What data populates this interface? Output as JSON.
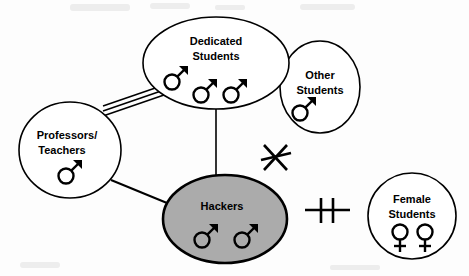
{
  "diagram": {
    "background_color": "#fdfdfd",
    "outline_color": "#000000",
    "highlight_fill_color": "#ababab",
    "nodes": [
      {
        "id": "dedicated-students",
        "label_lines": [
          "Dedicated",
          "Students"
        ],
        "label_line1": "Dedicated",
        "label_line2": "Students",
        "shape": "ellipse",
        "fill": "#ffffff",
        "cx": 216,
        "cy": 63,
        "rx": 73,
        "ry": 46,
        "members": [
          {
            "gender": "male",
            "symbol": "mars",
            "x": 172,
            "y": 79
          },
          {
            "gender": "male",
            "symbol": "mars",
            "x": 201,
            "y": 92
          },
          {
            "gender": "male",
            "symbol": "mars",
            "x": 231,
            "y": 92
          }
        ],
        "member_count": 3
      },
      {
        "id": "other-students",
        "label_lines": [
          "Other",
          "Students"
        ],
        "label_line1": "Other",
        "label_line2": "Students",
        "shape": "circle",
        "fill": "#ffffff",
        "cx": 320,
        "cy": 87,
        "rx": 40,
        "ry": 46,
        "members": [
          {
            "gender": "male",
            "symbol": "mars",
            "x": 302,
            "y": 110
          }
        ],
        "member_count": 1
      },
      {
        "id": "professors-teachers",
        "label_lines": [
          "Professors/",
          "Teachers"
        ],
        "label_line1": "Professors/",
        "label_line2": "Teachers",
        "shape": "circle",
        "fill": "#ffffff",
        "cx": 70,
        "cy": 150,
        "rx": 51,
        "ry": 48,
        "members": [
          {
            "gender": "male",
            "symbol": "mars",
            "x": 66,
            "y": 173
          }
        ],
        "member_count": 1
      },
      {
        "id": "hackers",
        "label_lines": [
          "Hackers"
        ],
        "label_line1": "Hackers",
        "label_line2": "",
        "shape": "ellipse",
        "fill": "#ababab",
        "cx": 225,
        "cy": 219,
        "rx": 62,
        "ry": 44,
        "members": [
          {
            "gender": "male",
            "symbol": "mars",
            "x": 202,
            "y": 237
          },
          {
            "gender": "male",
            "symbol": "mars",
            "x": 242,
            "y": 237
          }
        ],
        "member_count": 2
      },
      {
        "id": "female-students",
        "label_lines": [
          "Female",
          "Students"
        ],
        "label_line1": "Female",
        "label_line2": "Students",
        "shape": "circle",
        "fill": "#ffffff",
        "cx": 412,
        "cy": 216,
        "rx": 44,
        "ry": 43,
        "members": [
          {
            "gender": "female",
            "symbol": "venus",
            "x": 400,
            "y": 236
          },
          {
            "gender": "female",
            "symbol": "venus",
            "x": 425,
            "y": 236
          }
        ],
        "member_count": 2
      }
    ],
    "edges": [
      {
        "id": "professors-to-dedicated",
        "from": "professors-teachers",
        "to": "dedicated-students",
        "style": "triple-line",
        "line_count": 3,
        "x1": 103,
        "y1": 111,
        "x2": 163,
        "y2": 90
      },
      {
        "id": "dedicated-to-hackers",
        "from": "dedicated-students",
        "to": "hackers",
        "style": "single-line",
        "line_count": 1,
        "x1": 216,
        "y1": 108,
        "x2": 216,
        "y2": 177
      },
      {
        "id": "professors-to-hackers",
        "from": "professors-teachers",
        "to": "hackers",
        "style": "single-line",
        "line_count": 1,
        "x1": 111,
        "y1": 180,
        "x2": 167,
        "y2": 203
      }
    ],
    "markers": [
      {
        "id": "crossed-out-x",
        "type": "x-with-strike",
        "meaning": "no-connection",
        "cx": 275,
        "cy": 157,
        "size": 26
      },
      {
        "id": "double-bar",
        "type": "line-with-two-bars",
        "meaning": "blocked-connection",
        "cx": 327,
        "cy": 210,
        "width": 45,
        "height": 24
      }
    ]
  }
}
